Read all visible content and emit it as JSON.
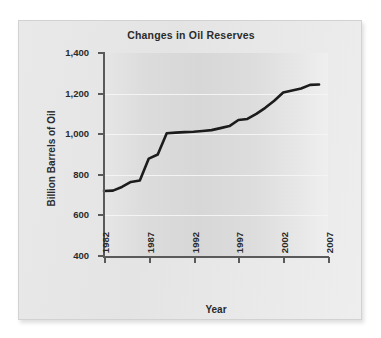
{
  "chart_data": {
    "type": "line",
    "title": "Changes in Oil Reserves",
    "xlabel": "Year",
    "ylabel": "Billion Barrels of Oil",
    "xlim": [
      1982,
      2007
    ],
    "ylim": [
      400,
      1400
    ],
    "grid": true,
    "legend": "none",
    "x_ticks": [
      "1982",
      "1987",
      "1992",
      "1997",
      "2002",
      "2007"
    ],
    "x_tick_values": [
      1982,
      1987,
      1992,
      1997,
      2002,
      2007
    ],
    "y_ticks": [
      "400",
      "600",
      "800",
      "1,000",
      "1,200",
      "1,400"
    ],
    "y_tick_values": [
      400,
      600,
      800,
      1000,
      1200,
      1400
    ],
    "series": [
      {
        "name": "Oil reserves",
        "color": "#1c1c1c",
        "x": [
          1982,
          1983,
          1984,
          1985,
          1986,
          1987,
          1988,
          1989,
          1990,
          1991,
          1992,
          1993,
          1994,
          1995,
          1996,
          1997,
          1998,
          1999,
          2000,
          2001,
          2002,
          2003,
          2004,
          2005,
          2006
        ],
        "values": [
          720,
          722,
          740,
          765,
          772,
          880,
          900,
          1005,
          1008,
          1010,
          1012,
          1016,
          1020,
          1030,
          1040,
          1070,
          1075,
          1100,
          1130,
          1165,
          1205,
          1215,
          1225,
          1243,
          1245
        ]
      }
    ]
  }
}
